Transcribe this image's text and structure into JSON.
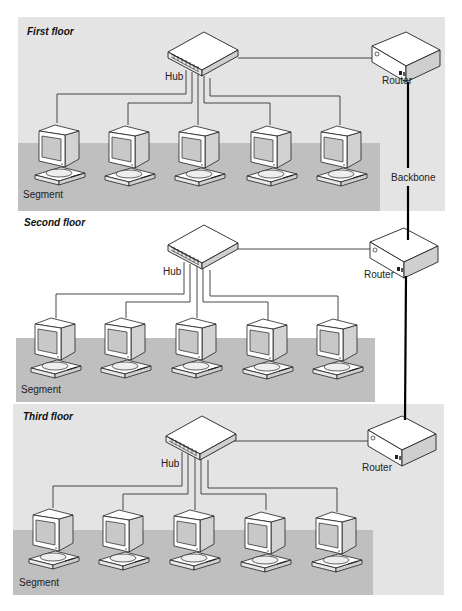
{
  "diagram": {
    "type": "network-topology",
    "backbone_label": "Backbone",
    "colors": {
      "floor_panel": "#e4e4e4",
      "segment_panel": "#bfbfbf",
      "line": "#333333",
      "backbone": "#000000",
      "device_fill": "#ffffff",
      "device_side": "#cfcfcf"
    },
    "floors": [
      {
        "id": "first",
        "label": "First floor",
        "hub_label": "Hub",
        "router_label": "Router",
        "segment_label": "Segment",
        "workstations": 5
      },
      {
        "id": "second",
        "label": "Second floor",
        "hub_label": "Hub",
        "router_label": "Router",
        "segment_label": "Segment",
        "workstations": 5
      },
      {
        "id": "third",
        "label": "Third floor",
        "hub_label": "Hub",
        "router_label": "Router",
        "segment_label": "Segment",
        "workstations": 5
      }
    ]
  }
}
